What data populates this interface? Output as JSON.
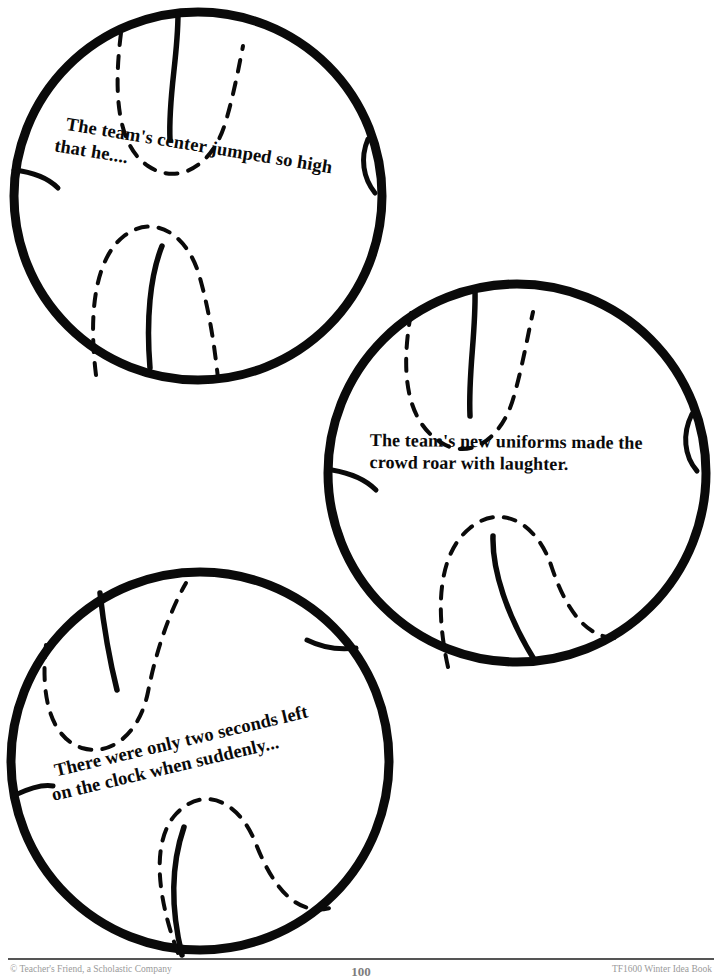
{
  "page": {
    "width": 722,
    "height": 977,
    "background": "#ffffff",
    "ink_color": "#0a0a0a",
    "type": "worksheet-story-starters"
  },
  "balls": [
    {
      "id": "ball-1",
      "shape": "basketball",
      "center_x": 198,
      "center_y": 196,
      "radius": 185,
      "text_lines": [
        "The team's center jumped so high",
        "that he...."
      ],
      "text_rotation_deg": 9.3
    },
    {
      "id": "ball-2",
      "shape": "basketball",
      "center_x": 517,
      "center_y": 473,
      "radius": 190,
      "text_lines": [
        "The team's new uniforms made the",
        "crowd roar with laughter."
      ],
      "text_rotation_deg": 0.6
    },
    {
      "id": "ball-3",
      "shape": "basketball",
      "center_x": 200,
      "center_y": 761,
      "radius": 190,
      "text_lines": [
        "There were only two seconds left",
        "on the clock when suddenly..."
      ],
      "text_rotation_deg": -13.2
    }
  ],
  "footer": {
    "left": "© Teacher's Friend, a Scholastic Company",
    "page_number": "100",
    "right": "TF1600 Winter Idea Book"
  }
}
